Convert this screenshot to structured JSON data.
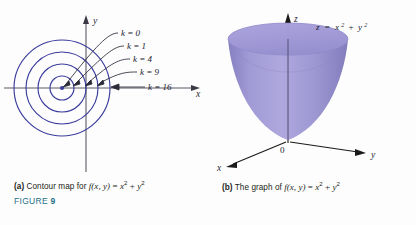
{
  "figure": {
    "label_prefix": "FIGURE",
    "number": "9",
    "label_color": "#1f6f8b"
  },
  "panel_a": {
    "caption_marker": "(a)",
    "caption_text": "Contour map for",
    "function_name": "f",
    "function_args": "(x, y)",
    "equals": "=",
    "rhs_first_base": "x",
    "rhs_first_exp": "2",
    "rhs_plus": "+",
    "rhs_second_base": "y",
    "rhs_second_exp": "2",
    "axis_x_label": "x",
    "axis_y_label": "y",
    "contour_color": "#3b3d9e",
    "axis_color": "#5a5a66",
    "contours": [
      {
        "label": "k = 0",
        "k": 0,
        "radius": 0.0,
        "label_x": 121,
        "label_y": 33
      },
      {
        "label": "k = 1",
        "k": 1,
        "radius": 12.0,
        "label_x": 127,
        "label_y": 46
      },
      {
        "label": "k = 4",
        "k": 4,
        "radius": 24.0,
        "label_x": 133,
        "label_y": 59
      },
      {
        "label": "k = 9",
        "k": 9,
        "radius": 36.0,
        "label_x": 140,
        "label_y": 72
      },
      {
        "label": "k = 16",
        "k": 16,
        "radius": 48.0,
        "label_x": 148,
        "label_y": 87
      }
    ],
    "center_x": 62,
    "center_y": 88
  },
  "panel_b": {
    "caption_marker": "(b)",
    "caption_text": "The graph of",
    "function_name": "f",
    "function_args": "(x, y)",
    "equals": "=",
    "rhs_first_base": "x",
    "rhs_first_exp": "2",
    "rhs_plus": "+",
    "rhs_second_base": "y",
    "rhs_second_exp": "2",
    "surface_equation_lhs": "z",
    "surface_equation_eq": "=",
    "surface_equation_first_base": "x",
    "surface_equation_first_exp": "2",
    "surface_equation_plus": "+",
    "surface_equation_second_base": "y",
    "surface_equation_second_exp": "2",
    "axis_x_label": "x",
    "axis_y_label": "y",
    "axis_z_label": "z",
    "origin_label": "0",
    "surface_color": "#8d86c9",
    "surface_color_light": "#b6b0de",
    "surface_color_dark": "#6f68ae",
    "axis_color": "#1a1a1a"
  }
}
